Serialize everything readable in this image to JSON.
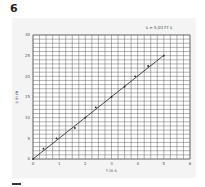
{
  "page": {
    "exercise_number": "6"
  },
  "chart_data": {
    "type": "scatter",
    "title": "",
    "xlabel": "t in s",
    "ylabel": "s in m",
    "xlim": [
      0,
      6
    ],
    "ylim": [
      0,
      30
    ],
    "x_ticks": [
      0,
      1,
      2,
      3,
      4,
      5,
      6
    ],
    "y_ticks": [
      0,
      5,
      10,
      15,
      20,
      25,
      30
    ],
    "x_tick_labels": [
      "0",
      "1",
      "2",
      "3",
      "4",
      "5",
      "6"
    ],
    "y_tick_labels": [
      "0",
      "5",
      "10",
      "15",
      "20",
      "25",
      "30"
    ],
    "grid": true,
    "grid_minor_x_step": 0.25,
    "grid_minor_y_step": 1,
    "legend": "none",
    "annotation": "s = 5,0177 s",
    "series": [
      {
        "name": "measurements",
        "kind": "points",
        "x": [
          0,
          0.4,
          0.9,
          1.6,
          2.0,
          2.4,
          3.0,
          3.5,
          3.9,
          4.4,
          5.0
        ],
        "y": [
          0,
          2.5,
          5,
          7.5,
          10,
          12.5,
          15,
          17.5,
          20,
          22.5,
          25
        ]
      },
      {
        "name": "fit",
        "kind": "line",
        "slope": 5.0177,
        "x": [
          0,
          5.0
        ],
        "y": [
          0,
          25.09
        ]
      }
    ],
    "colors": {
      "grid": "#555555",
      "line": "#222222",
      "points": "#222222",
      "background": "#f4f4f4"
    }
  }
}
